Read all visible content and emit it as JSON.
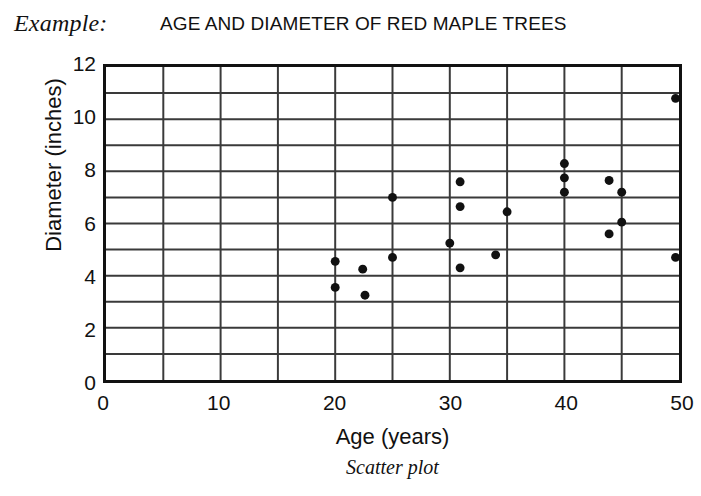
{
  "example_label": "Example:",
  "caption": "Scatter plot",
  "chart_data": {
    "type": "scatter",
    "title": "AGE AND DIAMETER OF RED MAPLE TREES",
    "xlabel": "Age (years)",
    "ylabel": "Diameter (inches)",
    "xlim": [
      0,
      50
    ],
    "ylim": [
      0,
      12
    ],
    "xticks": [
      0,
      10,
      20,
      30,
      40,
      50
    ],
    "yticks": [
      0,
      2,
      4,
      6,
      8,
      10,
      12
    ],
    "xtick_labels": [
      "0",
      "10",
      "20",
      "30",
      "40",
      "50"
    ],
    "ytick_labels": [
      "0",
      "2",
      "4",
      "6",
      "8",
      "10",
      "12"
    ],
    "x_gridline_step": 5,
    "y_gridline_step": 1,
    "grid": true,
    "legend": false,
    "marker": "filled-circle",
    "marker_color": "#111111",
    "marker_size": 9,
    "points": [
      {
        "x": 20.0,
        "y": 4.55
      },
      {
        "x": 20.0,
        "y": 3.55
      },
      {
        "x": 22.4,
        "y": 4.25
      },
      {
        "x": 22.6,
        "y": 3.25
      },
      {
        "x": 25.0,
        "y": 7.0
      },
      {
        "x": 25.0,
        "y": 4.7
      },
      {
        "x": 30.0,
        "y": 5.25
      },
      {
        "x": 30.9,
        "y": 7.6
      },
      {
        "x": 30.9,
        "y": 6.65
      },
      {
        "x": 30.9,
        "y": 4.3
      },
      {
        "x": 34.0,
        "y": 4.8
      },
      {
        "x": 35.0,
        "y": 6.45
      },
      {
        "x": 40.0,
        "y": 8.3
      },
      {
        "x": 40.0,
        "y": 7.75
      },
      {
        "x": 40.0,
        "y": 7.2
      },
      {
        "x": 43.9,
        "y": 7.65
      },
      {
        "x": 43.9,
        "y": 5.6
      },
      {
        "x": 45.0,
        "y": 7.2
      },
      {
        "x": 45.0,
        "y": 6.05
      },
      {
        "x": 49.7,
        "y": 10.8
      },
      {
        "x": 49.7,
        "y": 4.7
      }
    ]
  },
  "style": {
    "frame_color": "#111111",
    "grid_color": "#3a3a3a",
    "background": "#ffffff"
  }
}
